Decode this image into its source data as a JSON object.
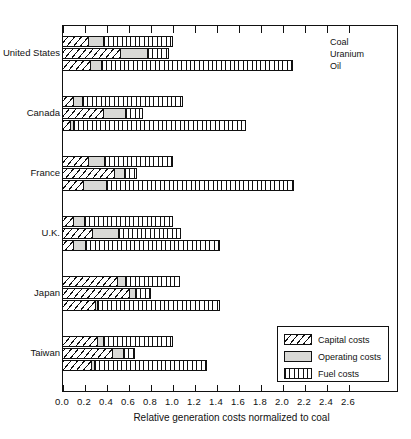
{
  "chart_data": {
    "type": "bar",
    "orientation": "horizontal",
    "title": "",
    "xlabel": "Relative generation costs normalized to coal",
    "ylabel": "",
    "xlim": [
      0.0,
      2.8
    ],
    "xticks": [
      "0.0",
      "0.2",
      "0.4",
      "0.6",
      "0.8",
      "1.0",
      "1.2",
      "1.4",
      "1.6",
      "1.8",
      "2.0",
      "2.2",
      "2.4",
      "2.6"
    ],
    "xtick_values": [
      0.0,
      0.2,
      0.4,
      0.6,
      0.8,
      1.0,
      1.2,
      1.4,
      1.6,
      1.8,
      2.0,
      2.2,
      2.4,
      2.6
    ],
    "grid": false,
    "legend_position": "inside-lower-right",
    "stack_components": [
      "Capital costs",
      "Operating costs",
      "Fuel costs"
    ],
    "categories": [
      "United States",
      "Canada",
      "France",
      "U.K.",
      "Japan",
      "Taiwan"
    ],
    "fuel_series": [
      "Coal",
      "Uranium",
      "Oil"
    ],
    "series": [
      {
        "name": "Capital costs",
        "values_by_group": {
          "United States": {
            "Coal": 0.24,
            "Uranium": 0.53,
            "Oil": 0.25
          },
          "Canada": {
            "Coal": 0.1,
            "Uranium": 0.37,
            "Oil": 0.07
          },
          "France": {
            "Coal": 0.24,
            "Uranium": 0.47,
            "Oil": 0.19
          },
          "U.K.": {
            "Coal": 0.1,
            "Uranium": 0.27,
            "Oil": 0.1
          },
          "Japan": {
            "Coal": 0.5,
            "Uranium": 0.61,
            "Oil": 0.3
          },
          "Taiwan": {
            "Coal": 0.32,
            "Uranium": 0.45,
            "Oil": 0.26
          }
        }
      },
      {
        "name": "Operating costs",
        "values_by_group": {
          "United States": {
            "Coal": 0.13,
            "Uranium": 0.24,
            "Oil": 0.1
          },
          "Canada": {
            "Coal": 0.08,
            "Uranium": 0.2,
            "Oil": 0.03
          },
          "France": {
            "Coal": 0.14,
            "Uranium": 0.09,
            "Oil": 0.21
          },
          "U.K.": {
            "Coal": 0.1,
            "Uranium": 0.24,
            "Oil": 0.11
          },
          "Japan": {
            "Coal": 0.07,
            "Uranium": 0.05,
            "Oil": 0.02
          },
          "Taiwan": {
            "Coal": 0.05,
            "Uranium": 0.1,
            "Oil": 0.03
          }
        }
      },
      {
        "name": "Fuel costs",
        "values_by_group": {
          "United States": {
            "Coal": 0.63,
            "Uranium": 0.19,
            "Oil": 1.74
          },
          "Canada": {
            "Coal": 0.91,
            "Uranium": 0.16,
            "Oil": 1.56
          },
          "France": {
            "Coal": 0.62,
            "Uranium": 0.11,
            "Oil": 1.7
          },
          "U.K.": {
            "Coal": 0.8,
            "Uranium": 0.56,
            "Oil": 1.22
          },
          "Japan": {
            "Coal": 0.49,
            "Uranium": 0.14,
            "Oil": 1.11
          },
          "Taiwan": {
            "Coal": 0.63,
            "Uranium": 0.1,
            "Oil": 1.02
          }
        }
      }
    ],
    "totals_by_group": {
      "United States": {
        "Coal": 1.0,
        "Uranium": 0.96,
        "Oil": 2.09
      },
      "Canada": {
        "Coal": 1.09,
        "Uranium": 0.73,
        "Oil": 1.66
      },
      "France": {
        "Coal": 1.0,
        "Uranium": 0.67,
        "Oil": 2.1
      },
      "U.K.": {
        "Coal": 1.0,
        "Uranium": 1.07,
        "Oil": 1.43
      },
      "Japan": {
        "Coal": 1.06,
        "Uranium": 0.8,
        "Oil": 1.43
      },
      "Taiwan": {
        "Coal": 1.0,
        "Uranium": 0.65,
        "Oil": 1.31
      }
    }
  },
  "axis": {
    "x_title": "Relative generation costs normalized to coal",
    "ticks": [
      "0.0",
      "0.2",
      "0.4",
      "0.6",
      "0.8",
      "1.0",
      "1.2",
      "1.4",
      "1.6",
      "1.8",
      "2.0",
      "2.2",
      "2.4",
      "2.6"
    ]
  },
  "categories": [
    {
      "label": "United States"
    },
    {
      "label": "Canada"
    },
    {
      "label": "France"
    },
    {
      "label": "U.K."
    },
    {
      "label": "Japan"
    },
    {
      "label": "Taiwan"
    }
  ],
  "series_annotations": [
    {
      "label": "Coal"
    },
    {
      "label": "Uranium"
    },
    {
      "label": "Oil"
    }
  ],
  "legend": {
    "items": [
      {
        "label": "Capital costs",
        "pattern": "diagonal-hatch"
      },
      {
        "label": "Operating costs",
        "pattern": "solid-grey"
      },
      {
        "label": "Fuel costs",
        "pattern": "vertical-hatch"
      }
    ]
  },
  "colors": {
    "ink": "#111111",
    "operating_fill": "#d9d9d6",
    "background": "#ffffff"
  }
}
